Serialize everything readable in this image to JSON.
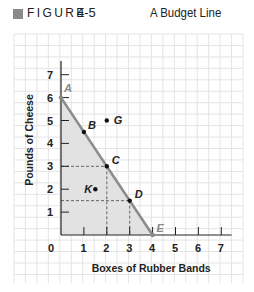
{
  "header": {
    "figure_label": "FIGURE",
    "figure_number": "4-5",
    "title": "A Budget Line"
  },
  "colors": {
    "grid": "#e4e4e4",
    "axis": "#222222",
    "budget_line": "#8c8c8c",
    "shaded_region": "#e2e2e2",
    "header_square": "#8a8a8a"
  },
  "chart_data": {
    "type": "line",
    "title": "A Budget Line",
    "xlabel": "Boxes of Rubber Bands",
    "ylabel": "Pounds of Cheese",
    "xlim": [
      0,
      7
    ],
    "ylim": [
      0,
      7
    ],
    "x_ticks": [
      "0",
      "1",
      "2",
      "3",
      "4",
      "5",
      "6",
      "7"
    ],
    "y_ticks": [
      "1",
      "2",
      "3",
      "4",
      "5",
      "6",
      "7"
    ],
    "grid": true,
    "series": [
      {
        "name": "Budget line",
        "x": [
          0,
          4
        ],
        "y": [
          6,
          0
        ],
        "shaded_below": true
      }
    ],
    "points": [
      {
        "label": "A",
        "x": 0,
        "y": 6,
        "on_line": true
      },
      {
        "label": "B",
        "x": 1,
        "y": 4.5,
        "on_line": true
      },
      {
        "label": "C",
        "x": 2,
        "y": 3,
        "on_line": true
      },
      {
        "label": "D",
        "x": 3,
        "y": 1.5,
        "on_line": true
      },
      {
        "label": "E",
        "x": 4,
        "y": 0,
        "on_line": true
      },
      {
        "label": "G",
        "x": 2,
        "y": 5,
        "on_line": false
      },
      {
        "label": "K",
        "x": 1.5,
        "y": 2,
        "on_line": false
      }
    ],
    "dashed_guides": [
      {
        "point": "C",
        "x": 2,
        "y": 3
      },
      {
        "point": "D",
        "x": 3,
        "y": 1.5
      }
    ]
  }
}
